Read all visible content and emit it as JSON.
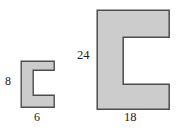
{
  "figure": {
    "background_color": "#ffffff",
    "fill_color": "#cccccc",
    "stroke_color": "#4d4d4d",
    "label_color": "#1a1a1a",
    "shapes": [
      {
        "id": "small-figure",
        "name": "small-c-shape",
        "width_label": "6",
        "height_label": "8",
        "outline_points": "0,0 33,0 33,9 12,9 12,34 33,34 33,46 0,46"
      },
      {
        "id": "large-figure",
        "name": "large-c-shape",
        "width_label": "18",
        "height_label": "24",
        "outline_points": "1,1 73,1 73,28 27,28 27,75 73,75 73,100 1,100"
      }
    ]
  },
  "labels": {
    "small_height": "8",
    "small_width": "6",
    "large_height": "24",
    "large_width": "18"
  }
}
